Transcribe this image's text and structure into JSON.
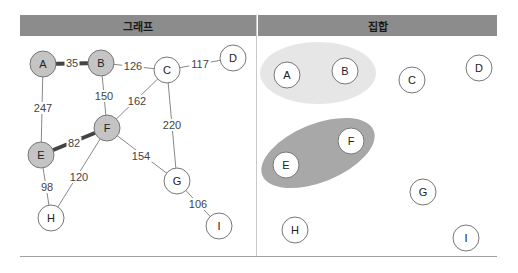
{
  "headers": {
    "graph": "그래프",
    "set": "집합"
  },
  "graph": {
    "nodes": [
      {
        "id": "A",
        "x": 43,
        "y": 64,
        "shaded": true
      },
      {
        "id": "B",
        "x": 101,
        "y": 63,
        "shaded": true
      },
      {
        "id": "C",
        "x": 167,
        "y": 70,
        "shaded": false
      },
      {
        "id": "D",
        "x": 233,
        "y": 58,
        "shaded": false
      },
      {
        "id": "E",
        "x": 41,
        "y": 155,
        "shaded": true
      },
      {
        "id": "F",
        "x": 107,
        "y": 128,
        "shaded": true
      },
      {
        "id": "G",
        "x": 177,
        "y": 181,
        "shaded": false
      },
      {
        "id": "H",
        "x": 51,
        "y": 218,
        "shaded": false
      },
      {
        "id": "I",
        "x": 219,
        "y": 226,
        "shaded": false
      }
    ],
    "edges": [
      {
        "from": "A",
        "to": "B",
        "weight": "35",
        "bold": true,
        "lx": 72,
        "ly": 63
      },
      {
        "from": "B",
        "to": "C",
        "weight": "126",
        "bold": false,
        "lx": 133,
        "ly": 66
      },
      {
        "from": "C",
        "to": "D",
        "weight": "117",
        "bold": false,
        "lx": 200,
        "ly": 64
      },
      {
        "from": "A",
        "to": "E",
        "weight": "247",
        "bold": false,
        "lx": 43,
        "ly": 108
      },
      {
        "from": "B",
        "to": "F",
        "weight": "150",
        "bold": false,
        "lx": 104,
        "ly": 96
      },
      {
        "from": "C",
        "to": "F",
        "weight": "162",
        "bold": false,
        "lx": 137,
        "ly": 101
      },
      {
        "from": "C",
        "to": "G",
        "weight": "220",
        "bold": false,
        "lx": 172,
        "ly": 125
      },
      {
        "from": "E",
        "to": "F",
        "weight": "82",
        "bold": true,
        "lx": 74,
        "ly": 143
      },
      {
        "from": "F",
        "to": "G",
        "weight": "154",
        "bold": false,
        "lx": 141,
        "ly": 156
      },
      {
        "from": "E",
        "to": "H",
        "weight": "98",
        "bold": false,
        "lx": 47,
        "ly": 187
      },
      {
        "from": "F",
        "to": "H",
        "weight": "120",
        "bold": false,
        "lx": 79,
        "ly": 177
      },
      {
        "from": "G",
        "to": "I",
        "weight": "106",
        "bold": false,
        "lx": 198,
        "ly": 204
      }
    ]
  },
  "sets": {
    "groups": [
      {
        "members": [
          "A",
          "B"
        ],
        "color": "#e4e4e4"
      },
      {
        "members": [
          "E",
          "F"
        ],
        "color": "#a6a6a6"
      }
    ],
    "nodes": [
      {
        "id": "A",
        "x": 287,
        "y": 75
      },
      {
        "id": "B",
        "x": 345,
        "y": 71
      },
      {
        "id": "C",
        "x": 412,
        "y": 80
      },
      {
        "id": "D",
        "x": 479,
        "y": 68
      },
      {
        "id": "E",
        "x": 286,
        "y": 165
      },
      {
        "id": "F",
        "x": 351,
        "y": 141
      },
      {
        "id": "G",
        "x": 423,
        "y": 192
      },
      {
        "id": "H",
        "x": 295,
        "y": 230
      },
      {
        "id": "I",
        "x": 466,
        "y": 238
      }
    ]
  }
}
